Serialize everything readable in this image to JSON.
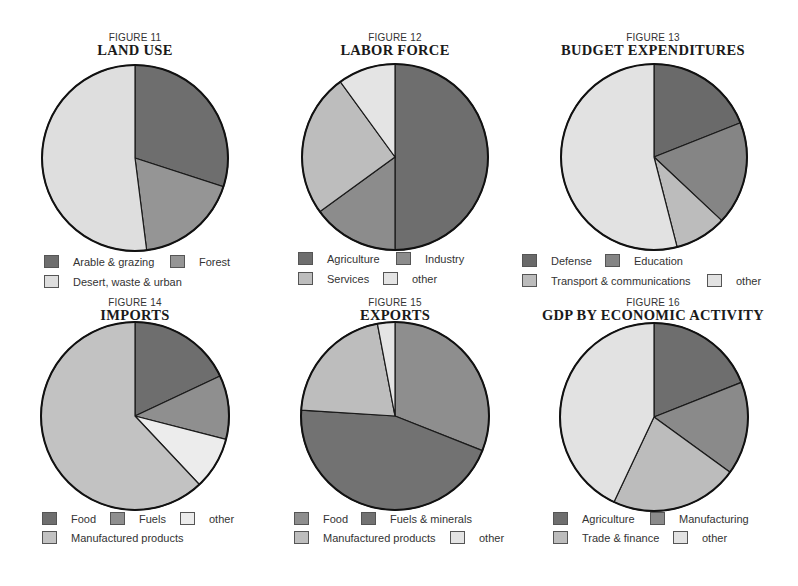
{
  "colors": {
    "dark": "#6e6e6e",
    "medium": "#8f8f8f",
    "light": "#bdbdbd",
    "lightest": "#e2e2e2",
    "outline": "#1a1a1a"
  },
  "figures": [
    {
      "number": "FIGURE 11",
      "title": "LAND USE"
    },
    {
      "number": "FIGURE 12",
      "title": "LABOR FORCE"
    },
    {
      "number": "FIGURE 13",
      "title": "BUDGET EXPENDITURES"
    },
    {
      "number": "FIGURE 14",
      "title": "IMPORTS"
    },
    {
      "number": "FIGURE 15",
      "title": "EXPORTS"
    },
    {
      "number": "FIGURE 16",
      "title": "GDP BY ECONOMIC ACTIVITY"
    }
  ],
  "chart_data": [
    {
      "type": "pie",
      "figure": "FIGURE 11",
      "title": "LAND USE",
      "categories": [
        "Arable & grazing",
        "Forest",
        "Desert, waste & urban"
      ],
      "values": [
        30,
        18,
        52
      ],
      "fills": [
        "#6e6e6e",
        "#959595",
        "#dedede"
      ],
      "legend_position": "bottom"
    },
    {
      "type": "pie",
      "figure": "FIGURE 12",
      "title": "LABOR FORCE",
      "categories": [
        "Agriculture",
        "Industry",
        "Services",
        "other"
      ],
      "values": [
        50,
        15,
        25,
        10
      ],
      "fills": [
        "#6e6e6e",
        "#8c8c8c",
        "#bdbdbd",
        "#e4e4e4"
      ],
      "legend_position": "bottom"
    },
    {
      "type": "pie",
      "figure": "FIGURE 13",
      "title": "BUDGET EXPENDITURES",
      "categories": [
        "Defense",
        "Education",
        "Transport & communications",
        "other"
      ],
      "values": [
        19,
        18,
        9,
        54
      ],
      "fills": [
        "#6a6a6a",
        "#858585",
        "#bcbcbc",
        "#e2e2e2"
      ],
      "legend_position": "bottom"
    },
    {
      "type": "pie",
      "figure": "FIGURE 14",
      "title": "IMPORTS",
      "categories": [
        "Food",
        "Fuels",
        "other",
        "Manufactured products"
      ],
      "values": [
        18,
        11,
        9,
        62
      ],
      "fills": [
        "#6e6e6e",
        "#8f8f8f",
        "#ececec",
        "#c2c2c2"
      ],
      "legend_position": "bottom"
    },
    {
      "type": "pie",
      "figure": "FIGURE 15",
      "title": "EXPORTS",
      "categories": [
        "Food",
        "Fuels & minerals",
        "Manufactured products",
        "other"
      ],
      "values": [
        31,
        45,
        21,
        3
      ],
      "fills": [
        "#8e8e8e",
        "#727272",
        "#bdbdbd",
        "#e4e4e4"
      ],
      "legend_position": "bottom"
    },
    {
      "type": "pie",
      "figure": "FIGURE 16",
      "title": "GDP BY ECONOMIC ACTIVITY",
      "categories": [
        "Agriculture",
        "Manufacturing",
        "Trade & finance",
        "other"
      ],
      "values": [
        19,
        16,
        22,
        43
      ],
      "fills": [
        "#6e6e6e",
        "#8a8a8a",
        "#bcbcbc",
        "#e2e2e2"
      ],
      "legend_position": "bottom"
    }
  ],
  "legends": {
    "fig11": [
      "Arable & grazing",
      "Forest",
      "Desert, waste & urban"
    ],
    "fig12": [
      "Agriculture",
      "Industry",
      "Services",
      "other"
    ],
    "fig13": [
      "Defense",
      "Education",
      "Transport & communications",
      "other"
    ],
    "fig14": [
      "Food",
      "Fuels",
      "other",
      "Manufactured products"
    ],
    "fig15": [
      "Food",
      "Fuels & minerals",
      "Manufactured products",
      "other"
    ],
    "fig16": [
      "Agriculture",
      "Manufacturing",
      "Trade & finance",
      "other"
    ]
  }
}
